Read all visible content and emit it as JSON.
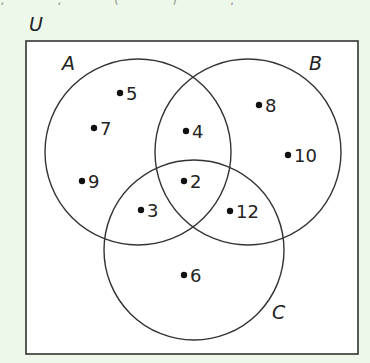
{
  "diagram": {
    "type": "venn",
    "universal_label": "U",
    "sets": [
      {
        "id": "A",
        "label": "A"
      },
      {
        "id": "B",
        "label": "B"
      },
      {
        "id": "C",
        "label": "C"
      }
    ],
    "elements": [
      {
        "value": "5",
        "region": "A only"
      },
      {
        "value": "7",
        "region": "A only"
      },
      {
        "value": "9",
        "region": "A only"
      },
      {
        "value": "4",
        "region": "A and B only"
      },
      {
        "value": "2",
        "region": "A and B and C"
      },
      {
        "value": "3",
        "region": "A and C only"
      },
      {
        "value": "12",
        "region": "B and C only"
      },
      {
        "value": "8",
        "region": "B only"
      },
      {
        "value": "10",
        "region": "B only"
      },
      {
        "value": "6",
        "region": "C only"
      }
    ],
    "colors": {
      "background": "#eef8ea",
      "box_fill": "#ffffff",
      "stroke": "#333333"
    }
  }
}
